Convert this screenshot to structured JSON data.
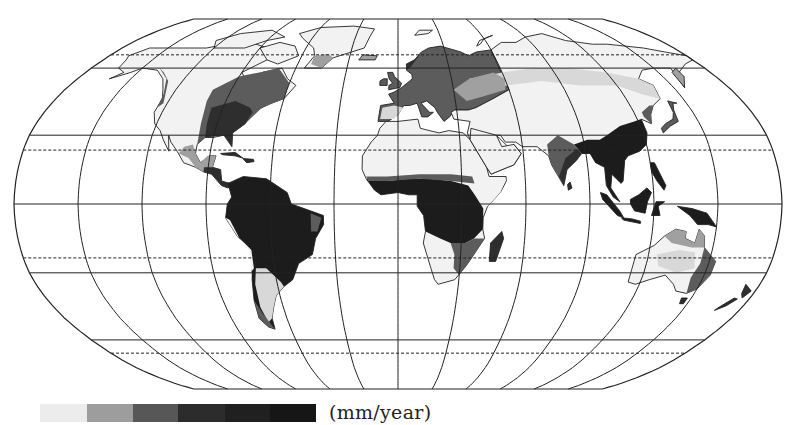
{
  "map": {
    "projection": "Robinson",
    "center_x": 398,
    "equator_y": 204,
    "half_width": 384,
    "half_height": 185,
    "graticule": {
      "meridian_step_deg": 30,
      "parallels_solid_deg": [
        60,
        30,
        0,
        -30,
        -60
      ],
      "parallels_dashed_deg": [
        66.5,
        23.5,
        -23.5,
        -66.5
      ]
    },
    "theme": "Annual precipitation",
    "colors": {
      "outline": "#222222",
      "land_dry": "#f2f2f2",
      "level_1": "#d8d8d8",
      "level_2": "#a0a0a0",
      "level_3": "#5c5c5c",
      "level_4": "#2e2e2e",
      "level_5": "#1c1c1c"
    }
  },
  "legend": {
    "unit_label": "(mm/year)",
    "swatches": [
      {
        "color": "#ececec",
        "width": 47
      },
      {
        "color": "#9d9d9d",
        "width": 46
      },
      {
        "color": "#575757",
        "width": 45
      },
      {
        "color": "#2c2c2c",
        "width": 47
      },
      {
        "color": "#202020",
        "width": 45
      },
      {
        "color": "#161616",
        "width": 46
      }
    ]
  }
}
